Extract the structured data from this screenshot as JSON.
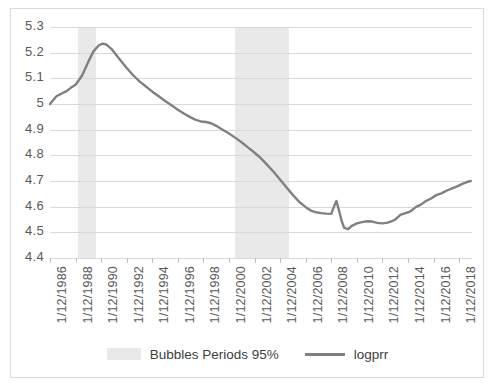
{
  "chart_data": {
    "type": "line",
    "title": "",
    "xlabel": "",
    "ylabel": "",
    "ylim": [
      4.4,
      5.3
    ],
    "ytick_labels": [
      "5.3",
      "5.2",
      "5.1",
      "5",
      "4.9",
      "4.8",
      "4.7",
      "4.6",
      "4.5",
      "4.4"
    ],
    "ytick_values": [
      5.3,
      5.2,
      5.1,
      5.0,
      4.9,
      4.8,
      4.7,
      4.6,
      4.5,
      4.4
    ],
    "grid": true,
    "legend_position": "bottom",
    "xtick_labels": [
      "1/12/1986",
      "1/12/1988",
      "1/12/1990",
      "1/12/1992",
      "1/12/1994",
      "1/12/1996",
      "1/12/1998",
      "1/12/2000",
      "1/12/2002",
      "1/12/2004",
      "1/12/2006",
      "1/12/2008",
      "1/12/2010",
      "1/12/2012",
      "1/12/2014",
      "1/12/2016",
      "1/12/2018"
    ],
    "xtick_values": [
      1986.0,
      1988.0,
      1990.0,
      1992.0,
      1994.0,
      1996.0,
      1998.0,
      2000.0,
      2002.0,
      2004.0,
      2006.0,
      2008.0,
      2010.0,
      2012.0,
      2014.0,
      2016.0,
      2018.0
    ],
    "xlim": [
      1986.0,
      2019.0
    ],
    "series": [
      {
        "name": "logprr",
        "color": "#808080",
        "x": [
          1986.0,
          1986.5,
          1987.0,
          1987.3,
          1987.6,
          1988.0,
          1988.5,
          1989.0,
          1989.4,
          1989.8,
          1990.1,
          1990.4,
          1990.8,
          1991.2,
          1991.6,
          1992.0,
          1992.5,
          1993.0,
          1993.5,
          1994.0,
          1994.5,
          1995.0,
          1995.5,
          1996.0,
          1996.5,
          1997.0,
          1997.4,
          1997.8,
          1998.2,
          1998.6,
          1999.0,
          1999.5,
          2000.0,
          2000.5,
          2001.0,
          2001.5,
          2002.0,
          2002.5,
          2003.0,
          2003.5,
          2004.0,
          2004.5,
          2005.0,
          2005.5,
          2006.0,
          2006.4,
          2006.8,
          2007.2,
          2007.6,
          2008.0,
          2008.2,
          2008.4,
          2008.6,
          2008.8,
          2009.0,
          2009.3,
          2009.6,
          2010.0,
          2010.4,
          2010.8,
          2011.2,
          2011.6,
          2012.0,
          2012.4,
          2012.8,
          2013.0,
          2013.4,
          2013.8,
          2014.2,
          2014.6,
          2015.0,
          2015.4,
          2015.8,
          2016.2,
          2016.6,
          2017.0,
          2017.4,
          2017.8,
          2018.2,
          2018.6,
          2018.9
        ],
        "y": [
          5.0,
          5.03,
          5.043,
          5.05,
          5.062,
          5.075,
          5.11,
          5.165,
          5.205,
          5.228,
          5.235,
          5.232,
          5.215,
          5.19,
          5.165,
          5.14,
          5.112,
          5.088,
          5.068,
          5.048,
          5.03,
          5.012,
          4.995,
          4.978,
          4.962,
          4.948,
          4.938,
          4.932,
          4.93,
          4.925,
          4.915,
          4.9,
          4.885,
          4.868,
          4.85,
          4.83,
          4.81,
          4.788,
          4.762,
          4.735,
          4.705,
          4.675,
          4.645,
          4.618,
          4.598,
          4.585,
          4.578,
          4.575,
          4.573,
          4.572,
          4.6,
          4.622,
          4.585,
          4.545,
          4.518,
          4.512,
          4.525,
          4.535,
          4.54,
          4.543,
          4.542,
          4.537,
          4.535,
          4.538,
          4.545,
          4.55,
          4.568,
          4.575,
          4.582,
          4.598,
          4.608,
          4.622,
          4.632,
          4.645,
          4.652,
          4.662,
          4.67,
          4.678,
          4.688,
          4.696,
          4.7
        ]
      }
    ],
    "shaded_regions": [
      {
        "label": "Bubbles Periods 95%",
        "color": "#e9e9e9",
        "start": 1988.2,
        "end": 1989.6
      },
      {
        "label": "Bubbles Periods 95%",
        "color": "#e9e9e9",
        "start": 2000.5,
        "end": 2004.7
      }
    ]
  },
  "legend": {
    "items": [
      {
        "label": "Bubbles Periods 95%",
        "type": "swatch"
      },
      {
        "label": "logprr",
        "type": "line"
      }
    ]
  }
}
